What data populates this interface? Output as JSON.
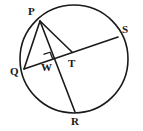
{
  "figure": {
    "background_color": "#ffffff",
    "stroke_color": "#1a1a1a",
    "label_color": "#1a1a1a"
  },
  "circle": {
    "name": "circle-outline",
    "center_x": 74,
    "center_y": 59,
    "radius": 54,
    "stroke_width": 1.6
  },
  "points": [
    {
      "id": "P",
      "label": "P",
      "x": 40,
      "y": 21,
      "label_x": 28,
      "label_y": 6,
      "on_circle": true
    },
    {
      "id": "Q",
      "label": "Q",
      "x": 24,
      "y": 69,
      "label_x": 10,
      "label_y": 66,
      "on_circle": true
    },
    {
      "id": "S",
      "label": "S",
      "x": 118,
      "y": 37,
      "label_x": 122,
      "label_y": 24,
      "on_circle": true
    },
    {
      "id": "R",
      "label": "R",
      "x": 75,
      "y": 112,
      "label_x": 71,
      "label_y": 116,
      "on_circle": true
    },
    {
      "id": "W",
      "label": "W",
      "x": 46,
      "y": 61,
      "label_x": 41,
      "label_y": 62,
      "on_circle": false
    },
    {
      "id": "T",
      "label": "T",
      "x": 72,
      "y": 52,
      "label_x": 68,
      "label_y": 58,
      "on_circle": false
    }
  ],
  "segments": [
    {
      "name": "chord-q-s",
      "from": "Q",
      "to": "S",
      "stroke_width": 1.6
    },
    {
      "name": "chord-p-r",
      "from": "P",
      "to": "R",
      "stroke_width": 1.6
    },
    {
      "name": "chord-p-q",
      "from": "P",
      "to": "Q",
      "stroke_width": 1.6
    },
    {
      "name": "segment-p-t",
      "from": "P",
      "to": "T",
      "stroke_width": 1.6
    }
  ],
  "right_angle": {
    "name": "right-angle-marker-at-w",
    "vertex_x": 46,
    "vertex_y": 61,
    "size": 7,
    "stroke_width": 1.3
  },
  "labels": {
    "P": "P",
    "Q": "Q",
    "R": "R",
    "S": "S",
    "T": "T",
    "W": "W"
  }
}
